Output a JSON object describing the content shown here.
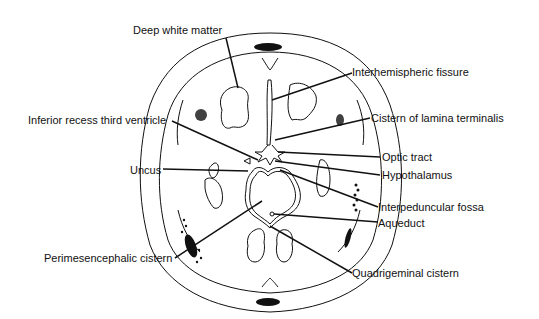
{
  "diagram": {
    "type": "anatomical-line-drawing",
    "colors": {
      "ink": "#111111",
      "background": "#ffffff"
    },
    "labels": [
      {
        "id": "deep-white-matter",
        "text": "Deep white matter"
      },
      {
        "id": "interhemispheric-fissure",
        "text": "Interhemispheric fissure"
      },
      {
        "id": "inferior-recess-third-ventricle",
        "text": "Inferior recess third ventricle"
      },
      {
        "id": "cistern-of-lamina-terminalis",
        "text": "Cistern of lamina terminalis"
      },
      {
        "id": "optic-tract",
        "text": "Optic tract"
      },
      {
        "id": "uncus",
        "text": "Uncus"
      },
      {
        "id": "hypothalamus",
        "text": "Hypothalamus"
      },
      {
        "id": "interpeduncular-fossa",
        "text": "Interpeduncular fossa"
      },
      {
        "id": "aqueduct",
        "text": "Aqueduct"
      },
      {
        "id": "perimesencephalic-cistern",
        "text": "Perimesencephalic cistern"
      },
      {
        "id": "quadrigeminal-cistern",
        "text": "Quadrigeminal cistern"
      }
    ]
  }
}
